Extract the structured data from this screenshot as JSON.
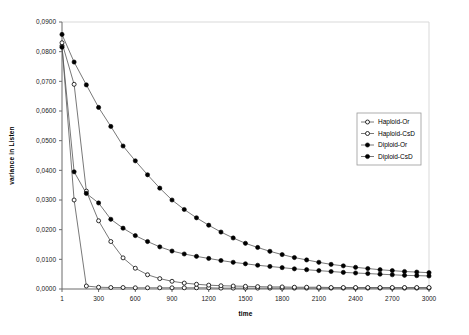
{
  "chart_data": {
    "type": "line",
    "title": "",
    "xlabel": "time",
    "ylabel": "variance in Listen",
    "xlim": [
      1,
      3000
    ],
    "ylim": [
      0.0,
      0.09
    ],
    "grid": false,
    "legend_position": "right",
    "xtick_labels": [
      "1",
      "300",
      "600",
      "900",
      "1200",
      "1500",
      "1800",
      "2100",
      "2400",
      "2700",
      "3000"
    ],
    "xtick_values": [
      1,
      300,
      600,
      900,
      1200,
      1500,
      1800,
      2100,
      2400,
      2700,
      3000
    ],
    "ytick_labels": [
      "0,0000",
      "0,0100",
      "0,0200",
      "0,0300",
      "0,0400",
      "0,0500",
      "0,0600",
      "0,0700",
      "0,0800",
      "0,0900"
    ],
    "ytick_values": [
      0.0,
      0.01,
      0.02,
      0.03,
      0.04,
      0.05,
      0.06,
      0.07,
      0.08,
      0.09
    ],
    "x": [
      1,
      100,
      200,
      300,
      400,
      500,
      600,
      700,
      800,
      900,
      1000,
      1100,
      1200,
      1300,
      1400,
      1500,
      1600,
      1700,
      1800,
      1900,
      2000,
      2100,
      2200,
      2300,
      2400,
      2500,
      2600,
      2700,
      2800,
      2900,
      3000
    ],
    "series": [
      {
        "name": "Haploid-Or",
        "marker": "open-circle",
        "color": "#000000",
        "values": [
          0.082,
          0.03,
          0.001,
          0.0006,
          0.0005,
          0.0005,
          0.0004,
          0.0004,
          0.0004,
          0.0004,
          0.0004,
          0.0004,
          0.0004,
          0.0003,
          0.0003,
          0.0003,
          0.0003,
          0.0003,
          0.0003,
          0.0003,
          0.0003,
          0.0003,
          0.0003,
          0.0003,
          0.0003,
          0.0003,
          0.0003,
          0.0003,
          0.0003,
          0.0003,
          0.0003
        ]
      },
      {
        "name": "Haploid-CsD",
        "marker": "open-circle",
        "color": "#000000",
        "values": [
          0.083,
          0.069,
          0.033,
          0.023,
          0.016,
          0.0105,
          0.007,
          0.0048,
          0.0035,
          0.0026,
          0.002,
          0.0016,
          0.0013,
          0.0011,
          0.001,
          0.0009,
          0.0008,
          0.0007,
          0.0007,
          0.0006,
          0.0006,
          0.0006,
          0.0005,
          0.0005,
          0.0005,
          0.0005,
          0.0005,
          0.0005,
          0.0005,
          0.0005,
          0.0005
        ]
      },
      {
        "name": "Diploid-Or",
        "marker": "filled-circle",
        "color": "#000000",
        "values": [
          0.0815,
          0.0395,
          0.0322,
          0.029,
          0.0235,
          0.0205,
          0.018,
          0.016,
          0.0142,
          0.0128,
          0.0118,
          0.011,
          0.0103,
          0.0096,
          0.009,
          0.0085,
          0.008,
          0.0076,
          0.0072,
          0.0068,
          0.0065,
          0.0062,
          0.0059,
          0.0056,
          0.0054,
          0.0052,
          0.005,
          0.0048,
          0.0046,
          0.0045,
          0.0044
        ]
      },
      {
        "name": "Diploid-CsD",
        "marker": "filled-circle",
        "color": "#000000",
        "values": [
          0.0858,
          0.0765,
          0.0688,
          0.0612,
          0.0548,
          0.0482,
          0.0432,
          0.0385,
          0.034,
          0.03,
          0.0268,
          0.024,
          0.0215,
          0.0192,
          0.0172,
          0.0154,
          0.014,
          0.0127,
          0.0116,
          0.0106,
          0.0098,
          0.009,
          0.0083,
          0.0078,
          0.0073,
          0.0069,
          0.0065,
          0.0062,
          0.0059,
          0.0057,
          0.0055
        ]
      }
    ]
  }
}
